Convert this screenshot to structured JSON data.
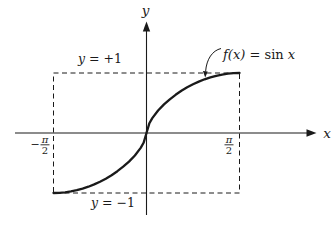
{
  "figure": {
    "background": "#ffffff",
    "ink": "#1a1a1a"
  },
  "axis": {
    "x_label": "x",
    "y_label": "y"
  },
  "bounds": {
    "upper": {
      "variable": "y",
      "equation": " = +1"
    },
    "lower": {
      "variable": "y",
      "equation": " = −1"
    }
  },
  "ticks": {
    "left": {
      "sign": "−",
      "numerator": "π",
      "denominator": "2"
    },
    "right": {
      "numerator": "π",
      "denominator": "2"
    }
  },
  "curve_label": {
    "function": "f(x)",
    "relation": " = sin ",
    "argument": "x"
  },
  "chart_data": {
    "type": "line",
    "title": "",
    "function_label": "f(x) = sin x",
    "xlabel": "x",
    "ylabel": "y",
    "x_ticks": [
      {
        "value": -1.5708,
        "label": "−π/2"
      },
      {
        "value": 1.5708,
        "label": "π/2"
      }
    ],
    "bound_lines": [
      {
        "y": 1,
        "label": "y = +1",
        "style": "dashed"
      },
      {
        "y": -1,
        "label": "y = −1",
        "style": "dashed"
      }
    ],
    "xlim": [
      -1.5708,
      1.5708
    ],
    "ylim": [
      -1,
      1
    ],
    "grid": false,
    "legend": "none",
    "points": [
      [
        -1.571,
        -1.0
      ],
      [
        -1.473,
        -0.997
      ],
      [
        -1.374,
        -0.988
      ],
      [
        -1.276,
        -0.974
      ],
      [
        -1.178,
        -0.954
      ],
      [
        -1.08,
        -0.927
      ],
      [
        -0.982,
        -0.895
      ],
      [
        -0.884,
        -0.857
      ],
      [
        -0.785,
        -0.812
      ],
      [
        -0.687,
        -0.761
      ],
      [
        -0.589,
        -0.703
      ],
      [
        -0.491,
        -0.637
      ],
      [
        -0.393,
        -0.562
      ],
      [
        -0.295,
        -0.476
      ],
      [
        -0.196,
        -0.375
      ],
      [
        -0.098,
        -0.249
      ],
      [
        -0.049,
        -0.164
      ],
      [
        0,
        0
      ],
      [
        0.049,
        0.164
      ],
      [
        0.098,
        0.249
      ],
      [
        0.196,
        0.375
      ],
      [
        0.295,
        0.476
      ],
      [
        0.393,
        0.562
      ],
      [
        0.491,
        0.637
      ],
      [
        0.589,
        0.703
      ],
      [
        0.687,
        0.761
      ],
      [
        0.785,
        0.812
      ],
      [
        0.884,
        0.857
      ],
      [
        0.982,
        0.895
      ],
      [
        1.08,
        0.927
      ],
      [
        1.178,
        0.954
      ],
      [
        1.276,
        0.974
      ],
      [
        1.374,
        0.988
      ],
      [
        1.473,
        0.997
      ],
      [
        1.571,
        1.0
      ]
    ]
  }
}
